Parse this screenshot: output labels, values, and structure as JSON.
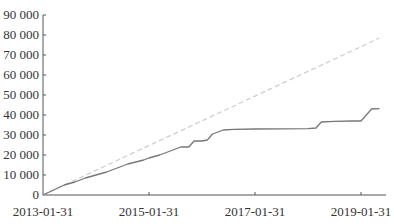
{
  "chart_data": {
    "type": "line",
    "title": "",
    "xlabel": "",
    "ylabel": "",
    "ylim": [
      0,
      90000
    ],
    "xlim": [
      "2013-01-31",
      "2019-05-31"
    ],
    "grid": false,
    "legend": null,
    "y_ticks": [
      0,
      10000,
      20000,
      30000,
      40000,
      50000,
      60000,
      70000,
      80000,
      90000
    ],
    "y_tick_labels": [
      "0",
      "10 000",
      "20 000",
      "30 000",
      "40 000",
      "50 000",
      "60 000",
      "70 000",
      "80 000",
      "90 000"
    ],
    "x_ticks": [
      "2013-01-31",
      "2015-01-31",
      "2017-01-31",
      "2019-01-31"
    ],
    "x_tick_labels": [
      "2013-01-31",
      "2015-01-31",
      "2017-01-31",
      "2019-01-31"
    ],
    "series": [
      {
        "name": "cumulative_actual",
        "style": "solid",
        "color": "#777777",
        "x_years": [
          0.0,
          0.2,
          0.4,
          0.6,
          0.8,
          1.0,
          1.2,
          1.4,
          1.6,
          1.75,
          1.9,
          2.0,
          2.2,
          2.35,
          2.5,
          2.6,
          2.75,
          2.85,
          3.0,
          3.1,
          3.2,
          3.3,
          3.4,
          3.6,
          4.0,
          5.0,
          5.15,
          5.25,
          5.5,
          5.85,
          6.0,
          6.2,
          6.35
        ],
        "values": [
          0,
          2500,
          5000,
          6500,
          8500,
          10000,
          11500,
          13500,
          15500,
          16500,
          17500,
          18500,
          20000,
          21500,
          23000,
          24000,
          24000,
          27000,
          27000,
          27500,
          30500,
          31500,
          32500,
          32800,
          33000,
          33200,
          33500,
          36500,
          36800,
          37000,
          37000,
          43000,
          43200
        ]
      },
      {
        "name": "linear_reference",
        "style": "dashed",
        "color": "#cccccc",
        "x_years": [
          0.0,
          6.35
        ],
        "values": [
          0,
          78500
        ]
      }
    ]
  }
}
